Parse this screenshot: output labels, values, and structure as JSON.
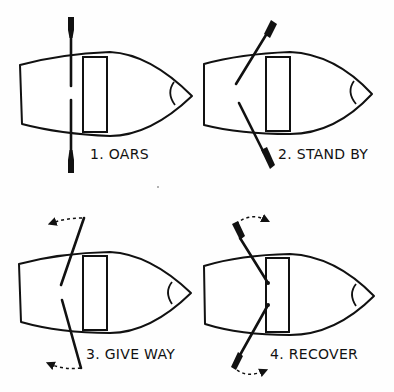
{
  "figure": {
    "panels": [
      {
        "id": 1,
        "label": "1. OARS",
        "oar_position": "oars",
        "arrows": "none"
      },
      {
        "id": 2,
        "label": "2. STAND BY",
        "oar_position": "stand-by",
        "arrows": "none"
      },
      {
        "id": 3,
        "label": "3. GIVE WAY",
        "oar_position": "give-way",
        "arrows": "dashed-curved-toward-stern"
      },
      {
        "id": 4,
        "label": "4. RECOVER",
        "oar_position": "recover",
        "arrows": "dashed-curved-toward-bow"
      }
    ],
    "caption": "",
    "colors": {
      "ink": "#111111",
      "paper": "#fefefe"
    }
  }
}
